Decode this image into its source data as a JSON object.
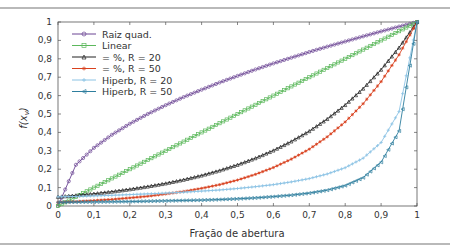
{
  "chart_data": {
    "type": "line",
    "title": "",
    "xlabel": "Fração de abertura",
    "ylabel": "f(x_v)",
    "xlim": [
      0,
      1
    ],
    "ylim": [
      0,
      1
    ],
    "grid": false,
    "legend_position": "upper left",
    "x_ticks": [
      "0",
      "0,1",
      "0,2",
      "0,3",
      "0,4",
      "0,5",
      "0,6",
      "0,7",
      "0,8",
      "0,9",
      "1"
    ],
    "y_ticks": [
      "0",
      "0,1",
      "0,2",
      "0,3",
      "0,4",
      "0,5",
      "0,6",
      "0,7",
      "0,8",
      "0,9",
      "1"
    ],
    "x": [
      0,
      0.05,
      0.1,
      0.15,
      0.2,
      0.25,
      0.3,
      0.35,
      0.4,
      0.45,
      0.5,
      0.55,
      0.6,
      0.65,
      0.7,
      0.75,
      0.8,
      0.85,
      0.9,
      0.95,
      1
    ],
    "series": [
      {
        "name": "Raiz quad.",
        "color": "#6b4593",
        "marker": "circle",
        "values": [
          0,
          0.224,
          0.316,
          0.387,
          0.447,
          0.5,
          0.548,
          0.592,
          0.632,
          0.671,
          0.707,
          0.742,
          0.775,
          0.806,
          0.837,
          0.866,
          0.894,
          0.922,
          0.949,
          0.975,
          1
        ]
      },
      {
        "name": "Linear",
        "color": "#5cb85c",
        "marker": "square",
        "values": [
          0,
          0.05,
          0.1,
          0.15,
          0.2,
          0.25,
          0.3,
          0.35,
          0.4,
          0.45,
          0.5,
          0.55,
          0.6,
          0.65,
          0.7,
          0.75,
          0.8,
          0.85,
          0.9,
          0.95,
          1
        ]
      },
      {
        "name": "= %, R = 20",
        "color": "#222222",
        "marker": "triangle-up",
        "values": [
          0.05,
          0.058,
          0.067,
          0.078,
          0.091,
          0.106,
          0.123,
          0.143,
          0.166,
          0.193,
          0.224,
          0.26,
          0.302,
          0.351,
          0.407,
          0.473,
          0.549,
          0.638,
          0.741,
          0.861,
          1
        ]
      },
      {
        "name": "= %, R = 50",
        "color": "#d9411e",
        "marker": "star",
        "values": [
          0.02,
          0.024,
          0.03,
          0.036,
          0.044,
          0.053,
          0.065,
          0.079,
          0.096,
          0.116,
          0.141,
          0.172,
          0.209,
          0.255,
          0.309,
          0.376,
          0.457,
          0.556,
          0.676,
          0.822,
          1
        ]
      },
      {
        "name": "Hiperb, R = 20",
        "color": "#8cc3e4",
        "marker": "plus",
        "values": [
          0.05,
          0.052,
          0.055,
          0.058,
          0.062,
          0.066,
          0.07,
          0.075,
          0.081,
          0.087,
          0.095,
          0.105,
          0.116,
          0.131,
          0.149,
          0.174,
          0.208,
          0.26,
          0.345,
          0.513,
          1
        ]
      },
      {
        "name": "Hiperb, R = 50",
        "color": "#2e7e9e",
        "marker": "triangle-left",
        "values": [
          0.02,
          0.021,
          0.022,
          0.023,
          0.024,
          0.026,
          0.028,
          0.03,
          0.032,
          0.035,
          0.039,
          0.044,
          0.051,
          0.059,
          0.07,
          0.086,
          0.111,
          0.154,
          0.238,
          0.408,
          1
        ]
      }
    ]
  }
}
